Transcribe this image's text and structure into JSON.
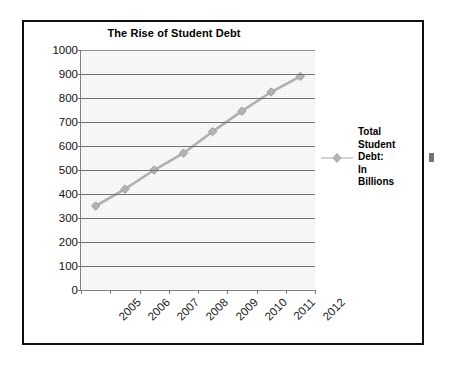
{
  "chart_data": {
    "type": "line",
    "title": "The Rise of Student Debt",
    "xlabel": "",
    "ylabel": "",
    "categories": [
      "2005",
      "2006",
      "2007",
      "2008",
      "2009",
      "2010",
      "2011",
      "2012"
    ],
    "values": [
      350,
      420,
      500,
      570,
      660,
      745,
      825,
      890
    ],
    "series": [
      {
        "name": "Total Student Debt: In Billions",
        "values": [
          350,
          420,
          500,
          570,
          660,
          745,
          825,
          890
        ]
      }
    ],
    "ylim": [
      0,
      1000
    ],
    "y_ticks": [
      0,
      100,
      200,
      300,
      400,
      500,
      600,
      700,
      800,
      900,
      1000
    ],
    "y_tick_labels": [
      "0",
      "100",
      "200",
      "300",
      "400",
      "500",
      "600",
      "700",
      "800",
      "900",
      "1000"
    ],
    "grid": true,
    "legend_position": "right",
    "marker": "diamond",
    "series_color": "#b0b0b0",
    "plot_background": "#eeeeee",
    "gridline_color": "#6f6f6f"
  },
  "legend": {
    "entry_label": "Total Student Debt: In Billions",
    "lines": [
      "Total",
      "Student",
      "Debt:",
      "In",
      "Billions"
    ],
    "marker_icon": "diamond-marker-icon"
  },
  "x_axis": {
    "labels": [
      "2005",
      "2006",
      "2007",
      "2008",
      "2009",
      "2010",
      "2011",
      "2012"
    ],
    "rotation_degrees": "-45"
  }
}
